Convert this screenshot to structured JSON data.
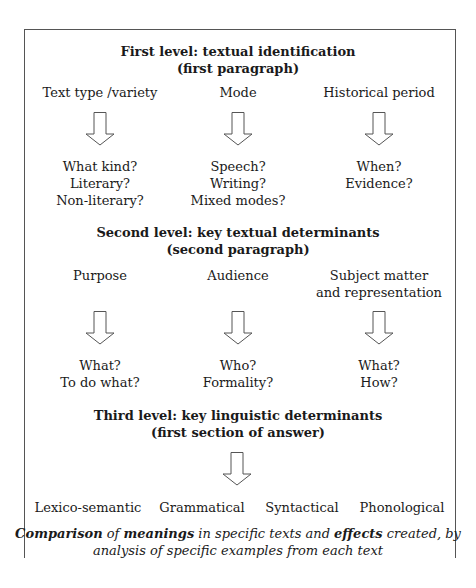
{
  "levels": [
    {
      "title": "First level: textual identification",
      "subtitle": "(first paragraph)",
      "columns": [
        {
          "label": "Text type /variety",
          "questions": [
            "What kind?",
            "Literary?",
            "Non-literary?"
          ]
        },
        {
          "label": "Mode",
          "questions": [
            "Speech?",
            "Writing?",
            "Mixed modes?"
          ]
        },
        {
          "label": "Historical period",
          "questions": [
            "When?",
            "Evidence?"
          ]
        }
      ]
    },
    {
      "title": "Second level: key textual determinants",
      "subtitle": "(second paragraph)",
      "columns": [
        {
          "label": "Purpose",
          "questions": [
            "What?",
            "To do what?"
          ]
        },
        {
          "label": "Audience",
          "questions": [
            "Who?",
            "Formality?"
          ]
        },
        {
          "label": "Subject matter",
          "label2": "and representation",
          "questions": [
            "What?",
            "How?"
          ]
        }
      ]
    },
    {
      "title": "Third level: key linguistic determinants",
      "subtitle": "(first section of answer)",
      "items": [
        "Lexico-semantic",
        "Grammatical",
        "Syntactical",
        "Phonological"
      ]
    }
  ],
  "footer": {
    "w1": "Comparison",
    "t1": " of ",
    "w2": "meanings",
    "t2": " in specific texts and ",
    "w3": "effects",
    "t3": " created, by",
    "line2": "analysis of specific examples from each text"
  },
  "icons": {
    "arrow": "down-arrow-icon"
  }
}
